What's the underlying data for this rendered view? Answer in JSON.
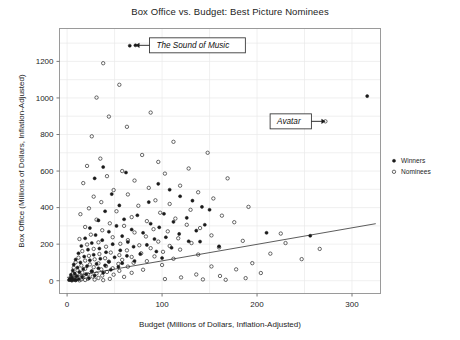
{
  "chart_data": {
    "type": "scatter",
    "title": "Box Office vs. Budget: Best Picture Nominees",
    "xlabel": "Budget (Millions of Dollars, Inflation-Adjusted)",
    "ylabel": "Box Office (Millions of Dollars, Inflation-Adjusted)",
    "xlim": [
      -8,
      330
    ],
    "ylim": [
      -70,
      1380
    ],
    "xticks": [
      0,
      100,
      200,
      300
    ],
    "yticks": [
      0,
      200,
      400,
      600,
      800,
      1000,
      1200
    ],
    "xtick_labels": [
      "0",
      "100",
      "200",
      "300"
    ],
    "ytick_labels": [
      "0",
      "200",
      "400",
      "600",
      "800",
      "1000",
      "1200"
    ],
    "grid": true,
    "grid_color": "#e9e9e9",
    "legend_position": "right-outside",
    "marker_color": "#1a1a1a",
    "trendline": {
      "label": "",
      "color": "#4a4a4a",
      "x": [
        0,
        325
      ],
      "y": [
        18,
        312
      ]
    },
    "annotations": [
      {
        "text": "The Sound of Music",
        "point_x": 72,
        "point_y": 1288,
        "box_x": 108,
        "box_y": 1288,
        "arrow": "left"
      },
      {
        "text": "Avatar",
        "point_x": 272,
        "point_y": 872,
        "box_x": 196,
        "box_y": 872,
        "arrow": "right"
      }
    ],
    "series": [
      {
        "name": "Winners",
        "marker": "filled-circle",
        "points": [
          [
            72,
            1288
          ],
          [
            66,
            1286
          ],
          [
            316,
            1010
          ],
          [
            38,
            622
          ],
          [
            62,
            592
          ],
          [
            29,
            560
          ],
          [
            96,
            530
          ],
          [
            108,
            498
          ],
          [
            47,
            474
          ],
          [
            119,
            462
          ],
          [
            132,
            438
          ],
          [
            86,
            430
          ],
          [
            55,
            412
          ],
          [
            142,
            404
          ],
          [
            150,
            388
          ],
          [
            40,
            380
          ],
          [
            102,
            366
          ],
          [
            74,
            358
          ],
          [
            126,
            344
          ],
          [
            60,
            336
          ],
          [
            33,
            330
          ],
          [
            112,
            322
          ],
          [
            88,
            312
          ],
          [
            145,
            306
          ],
          [
            52,
            300
          ],
          [
            97,
            292
          ],
          [
            24,
            288
          ],
          [
            68,
            280
          ],
          [
            136,
            274
          ],
          [
            44,
            268
          ],
          [
            80,
            262
          ],
          [
            118,
            256
          ],
          [
            30,
            250
          ],
          [
            58,
            244
          ],
          [
            104,
            238
          ],
          [
            19,
            232
          ],
          [
            92,
            228
          ],
          [
            37,
            222
          ],
          [
            128,
            216
          ],
          [
            64,
            212
          ],
          [
            26,
            206
          ],
          [
            48,
            200
          ],
          [
            84,
            196
          ],
          [
            15,
            190
          ],
          [
            70,
            186
          ],
          [
            110,
            180
          ],
          [
            34,
            176
          ],
          [
            22,
            170
          ],
          [
            56,
            166
          ],
          [
            94,
            160
          ],
          [
            41,
            156
          ],
          [
            12,
            150
          ],
          [
            77,
            146
          ],
          [
            28,
            142
          ],
          [
            63,
            136
          ],
          [
            18,
            132
          ],
          [
            50,
            128
          ],
          [
            100,
            124
          ],
          [
            35,
            120
          ],
          [
            9,
            116
          ],
          [
            24,
            112
          ],
          [
            71,
            108
          ],
          [
            44,
            104
          ],
          [
            14,
            100
          ],
          [
            58,
            96
          ],
          [
            31,
            92
          ],
          [
            7,
            88
          ],
          [
            40,
            84
          ],
          [
            21,
            80
          ],
          [
            54,
            76
          ],
          [
            11,
            72
          ],
          [
            33,
            68
          ],
          [
            17,
            64
          ],
          [
            46,
            60
          ],
          [
            6,
            56
          ],
          [
            26,
            52
          ],
          [
            13,
            48
          ],
          [
            38,
            44
          ],
          [
            8,
            40
          ],
          [
            20,
            36
          ],
          [
            4,
            32
          ],
          [
            29,
            28
          ],
          [
            10,
            24
          ],
          [
            16,
            20
          ],
          [
            5,
            16
          ],
          [
            23,
            14
          ],
          [
            3,
            10
          ],
          [
            12,
            8
          ],
          [
            7,
            6
          ],
          [
            2,
            4
          ],
          [
            9,
            3
          ],
          [
            5,
            2
          ],
          [
            140,
            214
          ],
          [
            160,
            188
          ],
          [
            210,
            262
          ],
          [
            256,
            246
          ]
        ]
      },
      {
        "name": "Nominees",
        "marker": "open-circle",
        "points": [
          [
            272,
            872
          ],
          [
            38,
            1190
          ],
          [
            55,
            1072
          ],
          [
            31,
            1002
          ],
          [
            88,
            920
          ],
          [
            112,
            760
          ],
          [
            44,
            898
          ],
          [
            63,
            842
          ],
          [
            26,
            790
          ],
          [
            148,
            700
          ],
          [
            79,
            688
          ],
          [
            35,
            668
          ],
          [
            96,
            650
          ],
          [
            21,
            628
          ],
          [
            128,
            614
          ],
          [
            58,
            600
          ],
          [
            103,
            586
          ],
          [
            42,
            572
          ],
          [
            169,
            560
          ],
          [
            71,
            548
          ],
          [
            17,
            534
          ],
          [
            119,
            520
          ],
          [
            86,
            508
          ],
          [
            49,
            496
          ],
          [
            138,
            484
          ],
          [
            64,
            472
          ],
          [
            28,
            460
          ],
          [
            154,
            450
          ],
          [
            93,
            440
          ],
          [
            36,
            430
          ],
          [
            108,
            420
          ],
          [
            75,
            410
          ],
          [
            191,
            404
          ],
          [
            23,
            396
          ],
          [
            130,
            388
          ],
          [
            52,
            380
          ],
          [
            98,
            372
          ],
          [
            14,
            364
          ],
          [
            163,
            356
          ],
          [
            68,
            348
          ],
          [
            114,
            340
          ],
          [
            31,
            334
          ],
          [
            84,
            326
          ],
          [
            176,
            320
          ],
          [
            45,
            314
          ],
          [
            126,
            306
          ],
          [
            60,
            300
          ],
          [
            19,
            294
          ],
          [
            140,
            288
          ],
          [
            91,
            282
          ],
          [
            37,
            276
          ],
          [
            106,
            270
          ],
          [
            71,
            264
          ],
          [
            225,
            258
          ],
          [
            25,
            252
          ],
          [
            152,
            248
          ],
          [
            83,
            242
          ],
          [
            48,
            238
          ],
          [
            117,
            232
          ],
          [
            13,
            228
          ],
          [
            64,
            222
          ],
          [
            185,
            218
          ],
          [
            96,
            214
          ],
          [
            33,
            210
          ],
          [
            131,
            206
          ],
          [
            56,
            202
          ],
          [
            21,
            198
          ],
          [
            76,
            194
          ],
          [
            108,
            190
          ],
          [
            41,
            186
          ],
          [
            160,
            182
          ],
          [
            88,
            178
          ],
          [
            28,
            174
          ],
          [
            119,
            170
          ],
          [
            63,
            166
          ],
          [
            16,
            162
          ],
          [
            101,
            158
          ],
          [
            46,
            154
          ],
          [
            78,
            150
          ],
          [
            34,
            146
          ],
          [
            138,
            143
          ],
          [
            55,
            140
          ],
          [
            23,
            136
          ],
          [
            92,
            133
          ],
          [
            68,
            130
          ],
          [
            12,
            126
          ],
          [
            40,
            123
          ],
          [
            112,
            120
          ],
          [
            29,
            117
          ],
          [
            58,
            114
          ],
          [
            19,
            110
          ],
          [
            84,
            107
          ],
          [
            44,
            104
          ],
          [
            9,
            101
          ],
          [
            70,
            98
          ],
          [
            33,
            95
          ],
          [
            54,
            92
          ],
          [
            24,
            89
          ],
          [
            100,
            86
          ],
          [
            15,
            83
          ],
          [
            41,
            80
          ],
          [
            64,
            77
          ],
          [
            28,
            74
          ],
          [
            7,
            71
          ],
          [
            48,
            68
          ],
          [
            19,
            65
          ],
          [
            36,
            62
          ],
          [
            80,
            60
          ],
          [
            11,
            57
          ],
          [
            55,
            54
          ],
          [
            26,
            51
          ],
          [
            42,
            48
          ],
          [
            16,
            45
          ],
          [
            68,
            43
          ],
          [
            31,
            40
          ],
          [
            6,
            38
          ],
          [
            22,
            35
          ],
          [
            49,
            33
          ],
          [
            13,
            30
          ],
          [
            37,
            28
          ],
          [
            9,
            26
          ],
          [
            27,
            23
          ],
          [
            60,
            21
          ],
          [
            17,
            19
          ],
          [
            4,
            17
          ],
          [
            33,
            15
          ],
          [
            11,
            13
          ],
          [
            22,
            11
          ],
          [
            45,
            10
          ],
          [
            7,
            8
          ],
          [
            15,
            7
          ],
          [
            29,
            6
          ],
          [
            3,
            5
          ],
          [
            19,
            4
          ],
          [
            9,
            3
          ],
          [
            38,
            3
          ],
          [
            5,
            2
          ],
          [
            13,
            2
          ],
          [
            195,
            96
          ],
          [
            214,
            148
          ],
          [
            247,
            118
          ],
          [
            230,
            206
          ],
          [
            266,
            174
          ],
          [
            152,
            78
          ],
          [
            178,
            62
          ],
          [
            204,
            42
          ],
          [
            136,
            34
          ],
          [
            161,
            26
          ],
          [
            120,
            18
          ],
          [
            188,
            14
          ],
          [
            103,
            9
          ],
          [
            143,
            7
          ],
          [
            167,
            5
          ]
        ]
      }
    ]
  },
  "legend": {
    "items": [
      {
        "label": "Winners",
        "marker": "filled-circle"
      },
      {
        "label": "Nominees",
        "marker": "open-circle"
      }
    ]
  }
}
